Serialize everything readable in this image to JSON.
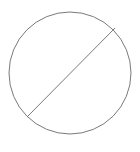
{
  "diagram": {
    "type": "circle-with-diagonal",
    "icon_semantic": "circle-slash-icon",
    "canvas": {
      "width": 140,
      "height": 152
    },
    "background": "#ffffff",
    "stroke_color": "#7a7a7a",
    "stroke_width": 1,
    "circle": {
      "cx": 70,
      "cy": 73,
      "r": 61
    },
    "diagonal": {
      "x1": 115,
      "y1": 28,
      "x2": 27,
      "y2": 117
    }
  }
}
